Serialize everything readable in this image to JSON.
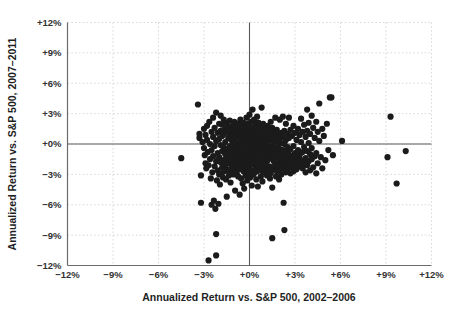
{
  "chart_data": {
    "type": "scatter",
    "title": "",
    "xlabel": "Annualized Return vs. S&P 500, 2002–2006",
    "ylabel": "Annualized Return vs. S&P 500, 2007–2011",
    "xlim": [
      -12,
      12
    ],
    "ylim": [
      -12,
      12
    ],
    "grid": true,
    "legend": "none",
    "marker_color": "#1b1b1b",
    "marker_size_px": 6.2,
    "gridline_color": "#cfcfcf",
    "axis_color": "#6b6b6b",
    "reference_lines": {
      "x": 0,
      "y": 0
    },
    "xticks": [
      "−12%",
      "−9%",
      "−6%",
      "−3%",
      "+0%",
      "+3%",
      "+6%",
      "+9%",
      "+12%"
    ],
    "xtick_values": [
      -12,
      -9,
      -6,
      -3,
      0,
      3,
      6,
      9,
      12
    ],
    "yticks": [
      "−12%",
      "−9%",
      "−6%",
      "−3%",
      "+0%",
      "+3%",
      "+6%",
      "+9%",
      "+12%"
    ],
    "ytick_values": [
      -12,
      -9,
      -6,
      -3,
      0,
      3,
      6,
      9,
      12
    ],
    "n_points": 330,
    "points": [
      [
        -4.5,
        -1.4
      ],
      [
        -3.4,
        3.9
      ],
      [
        -3.3,
        1.0
      ],
      [
        -3.3,
        0.6
      ],
      [
        -3.2,
        -3.1
      ],
      [
        -3.2,
        -5.8
      ],
      [
        -3.1,
        0.2
      ],
      [
        -3.0,
        1.5
      ],
      [
        -3.0,
        -0.4
      ],
      [
        -2.95,
        -1.1
      ],
      [
        -2.9,
        0.9
      ],
      [
        -2.9,
        -1.9
      ],
      [
        -2.85,
        -2.4
      ],
      [
        -2.8,
        1.8
      ],
      [
        -2.8,
        0.4
      ],
      [
        -2.75,
        -0.8
      ],
      [
        -2.7,
        -2.1
      ],
      [
        -2.7,
        -11.5
      ],
      [
        -2.65,
        2.2
      ],
      [
        -2.6,
        0.0
      ],
      [
        -2.6,
        -1.5
      ],
      [
        -2.55,
        -3.4
      ],
      [
        -2.5,
        1.2
      ],
      [
        -2.5,
        -0.6
      ],
      [
        -2.5,
        -6.0
      ],
      [
        -2.45,
        -2.8
      ],
      [
        -2.4,
        2.6
      ],
      [
        -2.4,
        0.7
      ],
      [
        -2.4,
        -1.2
      ],
      [
        -2.35,
        -5.6
      ],
      [
        -2.3,
        1.6
      ],
      [
        -2.3,
        -0.2
      ],
      [
        -2.3,
        -2.2
      ],
      [
        -2.25,
        -6.4
      ],
      [
        -2.2,
        3.1
      ],
      [
        -2.2,
        0.3
      ],
      [
        -2.2,
        -1.7
      ],
      [
        -2.2,
        -8.9
      ],
      [
        -2.2,
        -11.0
      ],
      [
        -2.15,
        -3.6
      ],
      [
        -2.1,
        1.1
      ],
      [
        -2.1,
        -0.9
      ],
      [
        -2.1,
        -2.6
      ],
      [
        -2.05,
        -5.9
      ],
      [
        -2.0,
        2.0
      ],
      [
        -2.0,
        0.5
      ],
      [
        -2.0,
        -1.3
      ],
      [
        -2.0,
        -3.0
      ],
      [
        -1.95,
        -4.0
      ],
      [
        -1.9,
        2.8
      ],
      [
        -1.9,
        1.3
      ],
      [
        -1.9,
        -0.1
      ],
      [
        -1.9,
        -1.8
      ],
      [
        -1.85,
        -2.9
      ],
      [
        -1.8,
        1.9
      ],
      [
        -1.8,
        0.8
      ],
      [
        -1.8,
        -0.7
      ],
      [
        -1.8,
        -2.3
      ],
      [
        -1.75,
        -3.3
      ],
      [
        -1.7,
        2.4
      ],
      [
        -1.7,
        1.0
      ],
      [
        -1.7,
        -0.3
      ],
      [
        -1.7,
        -1.6
      ],
      [
        -1.65,
        -2.7
      ],
      [
        -1.6,
        1.5
      ],
      [
        -1.6,
        0.2
      ],
      [
        -1.6,
        -1.0
      ],
      [
        -1.6,
        -2.1
      ],
      [
        -1.55,
        -3.5
      ],
      [
        -1.5,
        2.1
      ],
      [
        -1.5,
        1.2
      ],
      [
        -1.5,
        -0.5
      ],
      [
        -1.5,
        -1.4
      ],
      [
        -1.5,
        -5.2
      ],
      [
        -1.45,
        -2.5
      ],
      [
        -1.4,
        1.7
      ],
      [
        -1.4,
        0.6
      ],
      [
        -1.4,
        -0.8
      ],
      [
        -1.4,
        -1.9
      ],
      [
        -1.35,
        -3.1
      ],
      [
        -1.3,
        2.3
      ],
      [
        -1.3,
        1.0
      ],
      [
        -1.3,
        -0.2
      ],
      [
        -1.3,
        -1.2
      ],
      [
        -1.3,
        -2.8
      ],
      [
        -1.25,
        -3.8
      ],
      [
        -1.2,
        1.4
      ],
      [
        -1.2,
        0.4
      ],
      [
        -1.2,
        -0.6
      ],
      [
        -1.2,
        -1.7
      ],
      [
        -1.15,
        -2.3
      ],
      [
        -1.1,
        1.8
      ],
      [
        -1.1,
        0.9
      ],
      [
        -1.1,
        -0.1
      ],
      [
        -1.1,
        -1.1
      ],
      [
        -1.1,
        -2.0
      ],
      [
        -1.05,
        -3.0
      ],
      [
        -1.0,
        2.2
      ],
      [
        -1.0,
        1.1
      ],
      [
        -1.0,
        0.3
      ],
      [
        -1.0,
        -0.7
      ],
      [
        -1.0,
        -1.5
      ],
      [
        -1.0,
        -2.6
      ],
      [
        -0.95,
        -4.6
      ],
      [
        -0.9,
        1.6
      ],
      [
        -0.9,
        0.7
      ],
      [
        -0.9,
        -0.3
      ],
      [
        -0.9,
        -1.0
      ],
      [
        -0.9,
        -1.9
      ],
      [
        -0.85,
        -2.9
      ],
      [
        -0.8,
        2.0
      ],
      [
        -0.8,
        1.2
      ],
      [
        -0.8,
        0.1
      ],
      [
        -0.8,
        -0.6
      ],
      [
        -0.8,
        -1.4
      ],
      [
        -0.8,
        -2.2
      ],
      [
        -0.75,
        -3.2
      ],
      [
        -0.7,
        1.8
      ],
      [
        -0.7,
        0.9
      ],
      [
        -0.7,
        -0.1
      ],
      [
        -0.7,
        -0.9
      ],
      [
        -0.7,
        -1.7
      ],
      [
        -0.7,
        -2.5
      ],
      [
        -0.65,
        -5.0
      ],
      [
        -0.6,
        2.4
      ],
      [
        -0.6,
        1.3
      ],
      [
        -0.6,
        0.5
      ],
      [
        -0.6,
        -0.4
      ],
      [
        -0.6,
        -1.2
      ],
      [
        -0.6,
        -2.0
      ],
      [
        -0.55,
        -3.4
      ],
      [
        -0.5,
        1.9
      ],
      [
        -0.5,
        1.0
      ],
      [
        -0.5,
        0.2
      ],
      [
        -0.5,
        -0.7
      ],
      [
        -0.5,
        -1.5
      ],
      [
        -0.5,
        -2.3
      ],
      [
        -0.45,
        -3.9
      ],
      [
        -0.4,
        2.1
      ],
      [
        -0.4,
        1.4
      ],
      [
        -0.4,
        0.6
      ],
      [
        -0.4,
        -0.2
      ],
      [
        -0.4,
        -1.0
      ],
      [
        -0.4,
        -1.8
      ],
      [
        -0.4,
        -2.7
      ],
      [
        -0.35,
        -4.4
      ],
      [
        -0.3,
        1.7
      ],
      [
        -0.3,
        0.8
      ],
      [
        -0.3,
        0.0
      ],
      [
        -0.3,
        -0.8
      ],
      [
        -0.3,
        -1.3
      ],
      [
        -0.3,
        -2.1
      ],
      [
        -0.25,
        -3.1
      ],
      [
        -0.2,
        2.6
      ],
      [
        -0.2,
        1.5
      ],
      [
        -0.2,
        0.9
      ],
      [
        -0.2,
        0.3
      ],
      [
        -0.2,
        -0.5
      ],
      [
        -0.2,
        -1.6
      ],
      [
        -0.2,
        -2.4
      ],
      [
        -0.15,
        -3.6
      ],
      [
        -0.1,
        2.0
      ],
      [
        -0.1,
        1.1
      ],
      [
        -0.1,
        0.4
      ],
      [
        -0.1,
        -0.3
      ],
      [
        -0.1,
        -1.1
      ],
      [
        -0.1,
        -1.9
      ],
      [
        -0.1,
        -2.8
      ],
      [
        0.0,
        2.9
      ],
      [
        0.0,
        1.8
      ],
      [
        0.0,
        1.0
      ],
      [
        0.0,
        0.2
      ],
      [
        0.0,
        -0.6
      ],
      [
        0.0,
        -1.4
      ],
      [
        0.0,
        -2.2
      ],
      [
        0.05,
        -3.3
      ],
      [
        0.1,
        2.2
      ],
      [
        0.1,
        1.3
      ],
      [
        0.1,
        0.7
      ],
      [
        0.1,
        -0.1
      ],
      [
        0.1,
        -0.9
      ],
      [
        0.1,
        -1.7
      ],
      [
        0.1,
        -2.6
      ],
      [
        0.15,
        -4.1
      ],
      [
        0.2,
        3.4
      ],
      [
        0.2,
        1.6
      ],
      [
        0.2,
        0.9
      ],
      [
        0.2,
        0.3
      ],
      [
        0.2,
        -0.4
      ],
      [
        0.2,
        -1.2
      ],
      [
        0.2,
        -2.0
      ],
      [
        0.25,
        -3.0
      ],
      [
        0.3,
        2.4
      ],
      [
        0.3,
        1.2
      ],
      [
        0.3,
        0.5
      ],
      [
        0.3,
        -0.2
      ],
      [
        0.3,
        -1.0
      ],
      [
        0.3,
        -1.8
      ],
      [
        0.3,
        -2.9
      ],
      [
        0.4,
        1.9
      ],
      [
        0.4,
        1.0
      ],
      [
        0.4,
        0.2
      ],
      [
        0.4,
        -0.6
      ],
      [
        0.4,
        -1.5
      ],
      [
        0.4,
        -2.4
      ],
      [
        0.45,
        -3.5
      ],
      [
        0.5,
        2.7
      ],
      [
        0.5,
        1.4
      ],
      [
        0.5,
        0.7
      ],
      [
        0.5,
        0.0
      ],
      [
        0.5,
        -0.9
      ],
      [
        0.5,
        -1.9
      ],
      [
        0.5,
        -2.7
      ],
      [
        0.55,
        -4.2
      ],
      [
        0.6,
        2.1
      ],
      [
        0.6,
        1.1
      ],
      [
        0.6,
        0.4
      ],
      [
        0.6,
        -0.3
      ],
      [
        0.6,
        -1.3
      ],
      [
        0.6,
        -2.2
      ],
      [
        0.7,
        1.7
      ],
      [
        0.7,
        0.8
      ],
      [
        0.7,
        0.1
      ],
      [
        0.7,
        -0.7
      ],
      [
        0.7,
        -1.6
      ],
      [
        0.7,
        -2.5
      ],
      [
        0.75,
        -3.2
      ],
      [
        0.8,
        3.6
      ],
      [
        0.8,
        1.3
      ],
      [
        0.8,
        0.5
      ],
      [
        0.8,
        -0.2
      ],
      [
        0.8,
        -1.0
      ],
      [
        0.8,
        -2.0
      ],
      [
        0.85,
        -3.7
      ],
      [
        0.9,
        2.0
      ],
      [
        0.9,
        0.9
      ],
      [
        0.9,
        0.2
      ],
      [
        0.9,
        -0.6
      ],
      [
        0.9,
        -1.4
      ],
      [
        0.9,
        -2.8
      ],
      [
        1.0,
        1.5
      ],
      [
        1.0,
        0.6
      ],
      [
        1.0,
        -0.1
      ],
      [
        1.0,
        -0.9
      ],
      [
        1.0,
        -1.8
      ],
      [
        1.0,
        -2.4
      ],
      [
        1.1,
        1.1
      ],
      [
        1.1,
        0.3
      ],
      [
        1.1,
        -0.5
      ],
      [
        1.1,
        -1.2
      ],
      [
        1.1,
        -2.1
      ],
      [
        1.15,
        -3.1
      ],
      [
        1.2,
        1.8
      ],
      [
        1.2,
        0.8
      ],
      [
        1.2,
        0.0
      ],
      [
        1.2,
        -0.8
      ],
      [
        1.2,
        -1.6
      ],
      [
        1.2,
        -2.6
      ],
      [
        1.3,
        1.3
      ],
      [
        1.3,
        0.4
      ],
      [
        1.3,
        -0.3
      ],
      [
        1.3,
        -1.1
      ],
      [
        1.3,
        -2.2
      ],
      [
        1.35,
        -3.4
      ],
      [
        1.4,
        2.2
      ],
      [
        1.4,
        0.9
      ],
      [
        1.4,
        -0.6
      ],
      [
        1.4,
        -1.4
      ],
      [
        1.4,
        -2.9
      ],
      [
        1.5,
        1.6
      ],
      [
        1.5,
        0.5
      ],
      [
        1.5,
        -0.2
      ],
      [
        1.5,
        -1.0
      ],
      [
        1.5,
        -2.3
      ],
      [
        1.5,
        -4.3
      ],
      [
        1.5,
        -9.3
      ],
      [
        1.6,
        1.2
      ],
      [
        1.6,
        0.2
      ],
      [
        1.6,
        -0.7
      ],
      [
        1.6,
        -1.7
      ],
      [
        1.6,
        -2.5
      ],
      [
        1.7,
        2.6
      ],
      [
        1.7,
        0.8
      ],
      [
        1.7,
        -0.4
      ],
      [
        1.7,
        -1.3
      ],
      [
        1.7,
        -2.1
      ],
      [
        1.75,
        -3.2
      ],
      [
        1.8,
        1.4
      ],
      [
        1.8,
        0.3
      ],
      [
        1.8,
        -0.9
      ],
      [
        1.8,
        -1.9
      ],
      [
        1.8,
        -2.7
      ],
      [
        1.9,
        1.0
      ],
      [
        1.9,
        -0.1
      ],
      [
        1.9,
        -1.1
      ],
      [
        1.9,
        -2.3
      ],
      [
        1.95,
        -3.5
      ],
      [
        2.0,
        2.4
      ],
      [
        2.0,
        0.6
      ],
      [
        2.0,
        -0.5
      ],
      [
        2.0,
        -1.5
      ],
      [
        2.0,
        -2.6
      ],
      [
        2.1,
        1.1
      ],
      [
        2.1,
        0.1
      ],
      [
        2.1,
        -1.0
      ],
      [
        2.1,
        -2.0
      ],
      [
        2.1,
        -3.0
      ],
      [
        2.2,
        2.7
      ],
      [
        2.2,
        0.7
      ],
      [
        2.2,
        -0.6
      ],
      [
        2.2,
        -1.6
      ],
      [
        2.2,
        -2.4
      ],
      [
        2.25,
        -5.8
      ],
      [
        2.3,
        1.3
      ],
      [
        2.3,
        0.0
      ],
      [
        2.3,
        -1.2
      ],
      [
        2.3,
        -2.2
      ],
      [
        2.3,
        -8.5
      ],
      [
        2.4,
        2.0
      ],
      [
        2.4,
        0.4
      ],
      [
        2.4,
        -0.8
      ],
      [
        2.4,
        -1.9
      ],
      [
        2.4,
        -2.8
      ],
      [
        2.5,
        1.0
      ],
      [
        2.5,
        -0.3
      ],
      [
        2.5,
        -1.4
      ],
      [
        2.5,
        -2.5
      ],
      [
        2.6,
        2.6
      ],
      [
        2.6,
        0.6
      ],
      [
        2.6,
        -1.0
      ],
      [
        2.6,
        -2.1
      ],
      [
        2.7,
        1.4
      ],
      [
        2.7,
        -0.5
      ],
      [
        2.7,
        -1.7
      ],
      [
        2.7,
        -2.9
      ],
      [
        2.8,
        0.8
      ],
      [
        2.8,
        -1.2
      ],
      [
        2.8,
        -2.3
      ],
      [
        2.9,
        1.8
      ],
      [
        2.9,
        -0.2
      ],
      [
        2.9,
        -1.5
      ],
      [
        2.9,
        -2.7
      ],
      [
        3.0,
        1.1
      ],
      [
        3.0,
        -0.9
      ],
      [
        3.0,
        -2.0
      ],
      [
        3.1,
        0.4
      ],
      [
        3.1,
        -1.3
      ],
      [
        3.1,
        -2.5
      ],
      [
        3.2,
        1.5
      ],
      [
        3.2,
        -0.6
      ],
      [
        3.2,
        -1.8
      ],
      [
        3.3,
        0.9
      ],
      [
        3.3,
        -1.1
      ],
      [
        3.3,
        -2.2
      ],
      [
        3.4,
        2.5
      ],
      [
        3.4,
        0.2
      ],
      [
        3.4,
        -1.6
      ],
      [
        3.5,
        1.2
      ],
      [
        3.5,
        -0.8
      ],
      [
        3.5,
        -2.4
      ],
      [
        3.6,
        1.9
      ],
      [
        3.6,
        -0.3
      ],
      [
        3.6,
        -1.9
      ],
      [
        3.7,
        0.7
      ],
      [
        3.7,
        -1.4
      ],
      [
        3.7,
        -2.8
      ],
      [
        3.8,
        3.4
      ],
      [
        3.8,
        1.3
      ],
      [
        3.8,
        -0.7
      ],
      [
        3.8,
        -2.1
      ],
      [
        3.9,
        2.1
      ],
      [
        3.9,
        0.1
      ],
      [
        3.9,
        -1.7
      ],
      [
        4.0,
        1.0
      ],
      [
        4.0,
        -1.0
      ],
      [
        4.0,
        -2.6
      ],
      [
        4.1,
        2.8
      ],
      [
        4.1,
        -0.4
      ],
      [
        4.1,
        -1.5
      ],
      [
        4.2,
        1.6
      ],
      [
        4.2,
        -2.3
      ],
      [
        4.3,
        0.6
      ],
      [
        4.3,
        -1.2
      ],
      [
        4.4,
        2.2
      ],
      [
        4.4,
        -0.9
      ],
      [
        4.4,
        -2.9
      ],
      [
        4.5,
        1.2
      ],
      [
        4.5,
        -1.9
      ],
      [
        4.6,
        4.0
      ],
      [
        4.6,
        0.3
      ],
      [
        4.7,
        -1.3
      ],
      [
        4.8,
        1.5
      ],
      [
        4.8,
        -2.4
      ],
      [
        4.9,
        0.8
      ],
      [
        5.0,
        -1.6
      ],
      [
        5.1,
        2.0
      ],
      [
        5.2,
        -0.6
      ],
      [
        5.3,
        4.6
      ],
      [
        5.4,
        4.6
      ],
      [
        5.5,
        -1.1
      ],
      [
        6.1,
        0.3
      ],
      [
        9.1,
        -1.3
      ],
      [
        9.3,
        2.7
      ],
      [
        9.7,
        -3.9
      ],
      [
        10.3,
        -0.7
      ]
    ]
  },
  "axis": {
    "x_title": "Annualized Return vs. S&P 500, 2002–2006",
    "y_title": "Annualized Return vs. S&P 500, 2007–2011"
  }
}
